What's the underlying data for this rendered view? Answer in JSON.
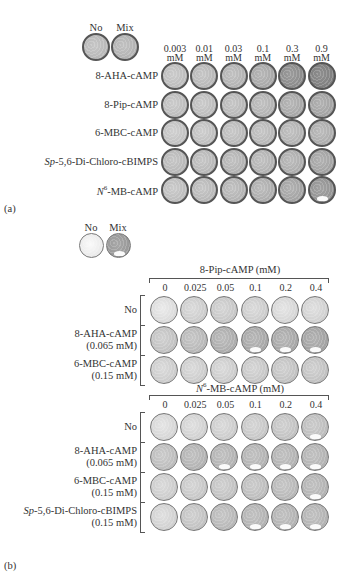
{
  "panel_a": {
    "label": "(a)",
    "controls": [
      {
        "label": "No",
        "shade": 0.72
      },
      {
        "label": "Mix",
        "shade": 0.7
      }
    ],
    "columns": [
      {
        "top": "0.003",
        "bottom": "mM"
      },
      {
        "top": "0.01",
        "bottom": "mM"
      },
      {
        "top": "0.03",
        "bottom": "mM"
      },
      {
        "top": "0.1",
        "bottom": "mM"
      },
      {
        "top": "0.3",
        "bottom": "mM"
      },
      {
        "top": "0.9",
        "bottom": "mM"
      }
    ],
    "rows": [
      {
        "label_pre": "",
        "label_sup": "",
        "label": "8-AHA-cAMP",
        "shades": [
          0.74,
          0.72,
          0.7,
          0.66,
          0.55,
          0.5
        ],
        "clear": [
          0,
          0,
          0,
          0,
          0,
          0
        ]
      },
      {
        "label_pre": "",
        "label_sup": "",
        "label": "8-Pip-cAMP",
        "shades": [
          0.74,
          0.74,
          0.72,
          0.7,
          0.66,
          0.64
        ],
        "clear": [
          0,
          0,
          0,
          0,
          0,
          0
        ]
      },
      {
        "label_pre": "",
        "label_sup": "",
        "label": "6-MBC-cAMP",
        "shades": [
          0.76,
          0.75,
          0.73,
          0.72,
          0.7,
          0.68
        ],
        "clear": [
          0,
          0,
          0,
          0,
          0,
          0
        ]
      },
      {
        "label_pre": "Sp",
        "label_sup": "",
        "label": "-5,6-Di-Chloro-cBIMPS",
        "shades": [
          0.72,
          0.72,
          0.7,
          0.7,
          0.68,
          0.64
        ],
        "clear": [
          0,
          0,
          0,
          0,
          0,
          0
        ]
      },
      {
        "label_pre": "N",
        "label_sup": "6",
        "label": "-MB-cAMP",
        "shades": [
          0.74,
          0.72,
          0.7,
          0.68,
          0.64,
          0.58
        ],
        "clear": [
          0,
          0,
          0,
          0,
          0,
          1
        ]
      }
    ]
  },
  "panel_b": {
    "label": "(b)",
    "controls": [
      {
        "label": "No",
        "shade": 0.92
      },
      {
        "label": "Mix",
        "shade": 0.6
      }
    ],
    "sub_panels": [
      {
        "title_pre": "",
        "title_sup": "",
        "title": "8-Pip-cAMP (mM)",
        "columns": [
          "0",
          "0.025",
          "0.05",
          "0.1",
          "0.2",
          "0.4"
        ],
        "rows": [
          {
            "line1_pre": "",
            "line1": "No",
            "line2": "",
            "shades": [
              0.86,
              0.8,
              0.78,
              0.8,
              0.84,
              0.82
            ],
            "clear": [
              0,
              0,
              0,
              0,
              0,
              0
            ]
          },
          {
            "line1_pre": "",
            "line1": "8-AHA-cAMP",
            "line2": "(0.065 mM)",
            "shades": [
              0.76,
              0.72,
              0.68,
              0.66,
              0.66,
              0.64
            ],
            "clear": [
              0,
              0,
              0,
              1,
              1,
              1
            ]
          },
          {
            "line1_pre": "",
            "line1": "6-MBC-cAMP",
            "line2": "(0.15 mM)",
            "shades": [
              0.8,
              0.8,
              0.8,
              0.78,
              0.76,
              0.76
            ],
            "clear": [
              0,
              0,
              0,
              0,
              0,
              0
            ]
          }
        ]
      },
      {
        "title_pre": "N",
        "title_sup": "6",
        "title": "-MB-cAMP (mM)",
        "columns": [
          "0",
          "0.025",
          "0.05",
          "0.1",
          "0.2",
          "0.4"
        ],
        "rows": [
          {
            "line1_pre": "",
            "line1": "No",
            "line2": "",
            "shades": [
              0.84,
              0.82,
              0.8,
              0.78,
              0.76,
              0.74
            ],
            "clear": [
              0,
              0,
              0,
              0,
              0,
              1
            ]
          },
          {
            "line1_pre": "",
            "line1": "8-AHA-cAMP",
            "line2": "(0.065 mM)",
            "shades": [
              0.74,
              0.7,
              0.7,
              0.7,
              0.7,
              0.7
            ],
            "clear": [
              0,
              0,
              1,
              1,
              1,
              1
            ]
          },
          {
            "line1_pre": "",
            "line1": "6-MBC-cAMP",
            "line2": "(0.15 mM)",
            "shades": [
              0.8,
              0.78,
              0.76,
              0.74,
              0.72,
              0.7
            ],
            "clear": [
              0,
              0,
              0,
              0,
              0,
              1
            ]
          },
          {
            "line1_pre": "Sp",
            "line1": "-5,6-Di-Chloro-cBIMPS",
            "line2": "(0.15 mM)",
            "shades": [
              0.82,
              0.76,
              0.72,
              0.7,
              0.7,
              0.7
            ],
            "clear": [
              0,
              0,
              0,
              1,
              1,
              1
            ]
          }
        ]
      }
    ]
  }
}
